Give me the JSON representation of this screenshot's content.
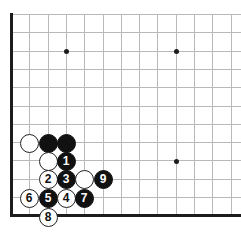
{
  "figure": {
    "kind": "go-board-diagram",
    "board": {
      "origin_x": 11,
      "origin_y": 14,
      "spacing": 18.3,
      "cols": 13,
      "rows": 12,
      "line_color": "#b9b9b9",
      "edge_color": "#1c1c1c",
      "background_color": "#ffffff"
    },
    "star_points": [
      {
        "x": 66,
        "y": 51
      },
      {
        "x": 176,
        "y": 51
      },
      {
        "x": 176,
        "y": 161
      }
    ],
    "stones": [
      {
        "id": "stone-white-a",
        "color": "white",
        "label": "",
        "x": 29,
        "y": 143
      },
      {
        "id": "stone-black-a",
        "color": "black",
        "label": "",
        "x": 48,
        "y": 143
      },
      {
        "id": "stone-black-b",
        "color": "black",
        "label": "",
        "x": 66,
        "y": 143
      },
      {
        "id": "stone-white-b",
        "color": "white",
        "label": "",
        "x": 48,
        "y": 161
      },
      {
        "id": "stone-move-1",
        "color": "black",
        "label": "1",
        "x": 66,
        "y": 161
      },
      {
        "id": "stone-move-2",
        "color": "white",
        "label": "2",
        "x": 48,
        "y": 179
      },
      {
        "id": "stone-move-3",
        "color": "black",
        "label": "3",
        "x": 66,
        "y": 179
      },
      {
        "id": "stone-white-c",
        "color": "white",
        "label": "",
        "x": 84,
        "y": 179
      },
      {
        "id": "stone-move-9",
        "color": "black",
        "label": "9",
        "x": 103,
        "y": 179
      },
      {
        "id": "stone-move-6",
        "color": "white",
        "label": "6",
        "x": 29,
        "y": 198
      },
      {
        "id": "stone-move-5",
        "color": "black",
        "label": "5",
        "x": 48,
        "y": 198
      },
      {
        "id": "stone-move-4",
        "color": "white",
        "label": "4",
        "x": 66,
        "y": 198
      },
      {
        "id": "stone-move-7",
        "color": "black",
        "label": "7",
        "x": 84,
        "y": 198
      },
      {
        "id": "stone-move-8",
        "color": "white",
        "label": "8",
        "x": 48,
        "y": 217
      }
    ]
  }
}
